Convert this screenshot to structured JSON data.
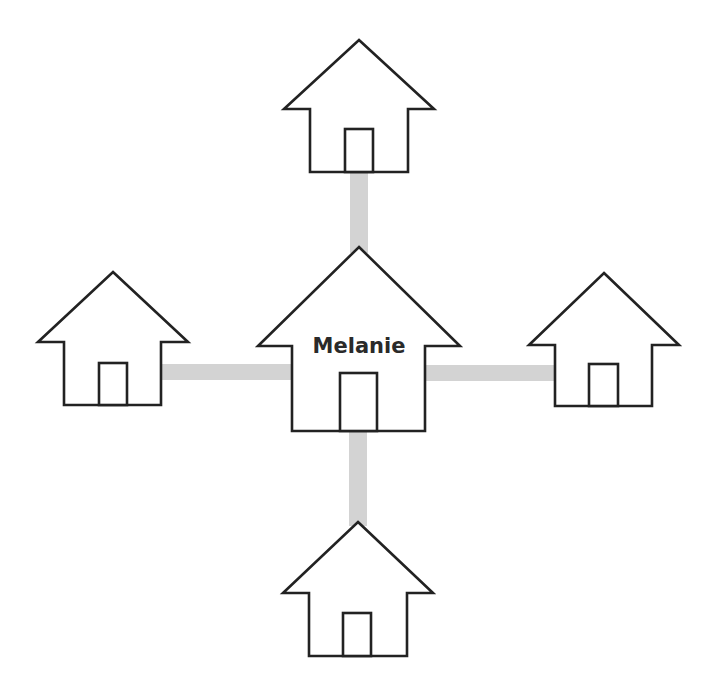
{
  "diagram": {
    "center_house": {
      "label": "Melanie"
    },
    "neighbors": [
      {
        "position": "top",
        "label": ""
      },
      {
        "position": "left",
        "label": ""
      },
      {
        "position": "right",
        "label": ""
      },
      {
        "position": "bottom",
        "label": ""
      }
    ],
    "colors": {
      "outline": "#222222",
      "connector": "#d3d3d3",
      "fill": "#ffffff",
      "text": "#2a2a2a"
    }
  }
}
